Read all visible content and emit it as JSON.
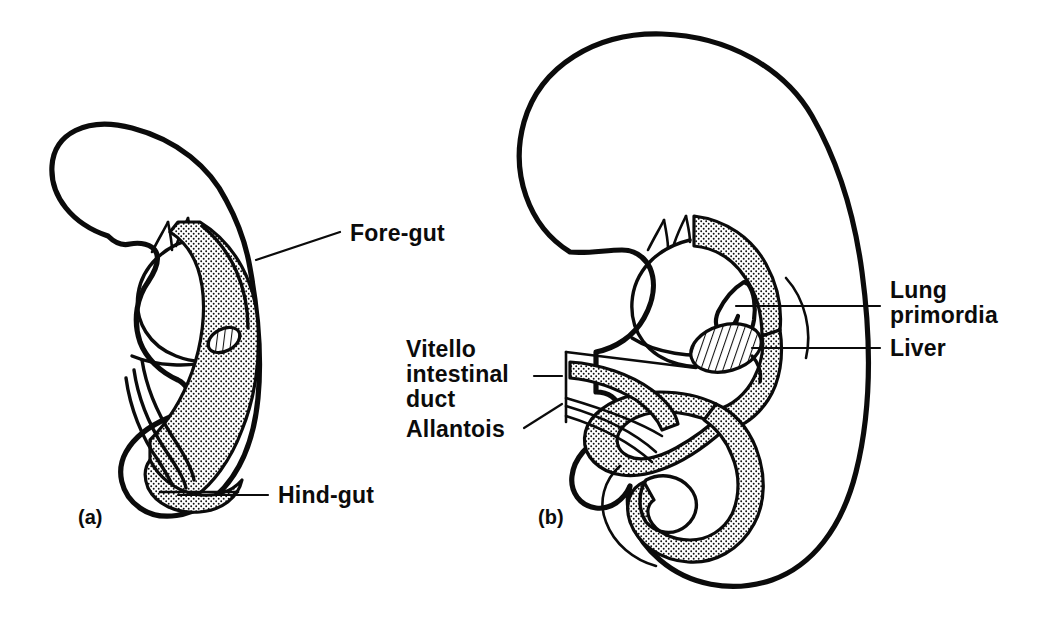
{
  "figure": {
    "background_color": "#ffffff",
    "ink_color": "#0b0b0b",
    "panels": [
      {
        "tag": "(a)",
        "name": "early-embryo-panel",
        "description": "Early embryo sagittal section showing simple gut tube",
        "labels": [
          {
            "id": "fore-gut",
            "text": "Fore-gut"
          },
          {
            "id": "hind-gut",
            "text": "Hind-gut"
          }
        ]
      },
      {
        "tag": "(b)",
        "name": "later-embryo-panel",
        "description": "Later embryo sagittal section showing gut loop, liver and lung buds",
        "labels": [
          {
            "id": "lung-primordia-line1",
            "text": "Lung"
          },
          {
            "id": "lung-primordia-line2",
            "text": "primordia"
          },
          {
            "id": "liver",
            "text": "Liver"
          },
          {
            "id": "vitello-line1",
            "text": "Vitello"
          },
          {
            "id": "vitello-line2",
            "text": "intestinal"
          },
          {
            "id": "vitello-line3",
            "text": "duct"
          },
          {
            "id": "allantois",
            "text": "Allantois"
          }
        ]
      }
    ],
    "legend_patterns": {
      "gut_endoderm": "stippled",
      "liver_primordium": "diagonal-hatched",
      "body_wall": "solid-outline"
    }
  }
}
